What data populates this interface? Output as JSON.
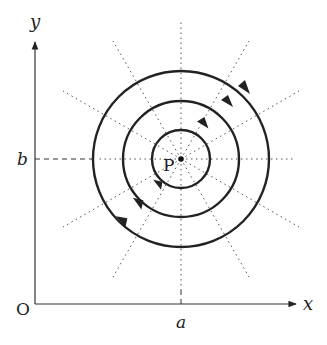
{
  "diagram": {
    "type": "magnetic field lines around a current-carrying wire",
    "labels": {
      "x_axis": "x",
      "y_axis": "y",
      "origin": "O",
      "x_mark": "a",
      "y_mark": "b",
      "point": "P"
    },
    "center": {
      "x": "a",
      "y": "b"
    },
    "circles": {
      "count": 3,
      "direction": "counterclockwise"
    },
    "radial_lines": {
      "count": 12,
      "style": "dotted"
    },
    "colors": {
      "line": "#222222",
      "dotted": "#555555"
    }
  }
}
